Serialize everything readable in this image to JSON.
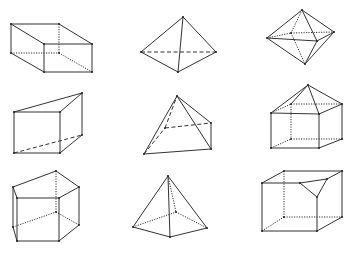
{
  "diagram": {
    "title": "",
    "colors": {
      "line": "#333333",
      "background": "#ffffff"
    },
    "figures": [
      {
        "id": "rectangular-box",
        "solid": [
          [
            11,
            24,
            59,
            24
          ],
          [
            59,
            24,
            92,
            44
          ],
          [
            92,
            44,
            44,
            44
          ],
          [
            44,
            44,
            11,
            24
          ],
          [
            11,
            24,
            11,
            53
          ],
          [
            44,
            44,
            44,
            72
          ],
          [
            92,
            44,
            92,
            72
          ],
          [
            11,
            53,
            44,
            72
          ],
          [
            44,
            72,
            92,
            72
          ]
        ],
        "dashed": [],
        "dotted": [
          [
            59,
            24,
            59,
            53
          ],
          [
            11,
            53,
            59,
            53
          ],
          [
            59,
            53,
            92,
            72
          ]
        ]
      },
      {
        "id": "triangular-pyramid",
        "solid": [
          [
            183,
            17,
            141,
            52
          ],
          [
            183,
            17,
            216,
            52
          ],
          [
            183,
            17,
            178,
            72
          ],
          [
            141,
            52,
            178,
            72
          ],
          [
            178,
            72,
            216,
            52
          ]
        ],
        "dashed": [
          [
            141,
            52,
            216,
            52
          ]
        ],
        "dotted": []
      },
      {
        "id": "octahedron",
        "solid": [
          [
            302,
            10,
            267,
            38
          ],
          [
            302,
            10,
            334,
            32
          ],
          [
            302,
            10,
            317,
            41
          ],
          [
            267,
            38,
            317,
            41
          ],
          [
            317,
            41,
            334,
            32
          ],
          [
            267,
            38,
            305,
            64
          ],
          [
            317,
            41,
            305,
            64
          ],
          [
            334,
            32,
            305,
            64
          ]
        ],
        "dashed": [],
        "dotted": [
          [
            302,
            10,
            291,
            33
          ],
          [
            267,
            38,
            291,
            33
          ],
          [
            291,
            33,
            334,
            32
          ],
          [
            291,
            33,
            305,
            64
          ]
        ]
      },
      {
        "id": "triangular-prism",
        "solid": [
          [
            14,
            112,
            60,
            112
          ],
          [
            60,
            112,
            82,
            93
          ],
          [
            14,
            112,
            82,
            93
          ],
          [
            14,
            112,
            14,
            153
          ],
          [
            60,
            112,
            60,
            153
          ],
          [
            82,
            93,
            82,
            135
          ],
          [
            14,
            153,
            60,
            153
          ],
          [
            60,
            153,
            82,
            135
          ]
        ],
        "dashed": [
          [
            14,
            153,
            82,
            135
          ]
        ],
        "dotted": []
      },
      {
        "id": "square-pyramid-tilted",
        "solid": [
          [
            177,
            96,
            144,
            154
          ],
          [
            177,
            96,
            211,
            123
          ],
          [
            177,
            96,
            211,
            149
          ],
          [
            144,
            154,
            211,
            149
          ],
          [
            211,
            123,
            211,
            149
          ]
        ],
        "dashed": [
          [
            144,
            154,
            165,
            128
          ],
          [
            165,
            128,
            177,
            96
          ],
          [
            165,
            128,
            211,
            123
          ]
        ],
        "dotted": []
      },
      {
        "id": "house-prism-pyramid",
        "solid": [
          [
            308,
            85,
            271,
            113
          ],
          [
            308,
            85,
            319,
            114
          ],
          [
            308,
            85,
            342,
            104
          ],
          [
            308,
            85,
            291,
            104
          ],
          [
            271,
            113,
            319,
            114
          ],
          [
            319,
            114,
            342,
            104
          ],
          [
            271,
            113,
            271,
            148
          ],
          [
            319,
            114,
            319,
            148
          ],
          [
            342,
            104,
            342,
            139
          ],
          [
            271,
            148,
            319,
            148
          ],
          [
            319,
            148,
            342,
            139
          ]
        ],
        "dashed": [],
        "dotted": [
          [
            271,
            113,
            291,
            104
          ],
          [
            291,
            104,
            342,
            104
          ],
          [
            291,
            104,
            291,
            139
          ],
          [
            271,
            148,
            291,
            139
          ],
          [
            291,
            139,
            342,
            139
          ]
        ]
      },
      {
        "id": "pentagonal-prism",
        "solid": [
          [
            13,
            187,
            56,
            171
          ],
          [
            56,
            171,
            79,
            187
          ],
          [
            79,
            187,
            59,
            198
          ],
          [
            59,
            198,
            17,
            198
          ],
          [
            17,
            198,
            13,
            187
          ],
          [
            13,
            187,
            13,
            227
          ],
          [
            79,
            187,
            79,
            225
          ],
          [
            59,
            198,
            59,
            241
          ],
          [
            17,
            198,
            17,
            241
          ],
          [
            13,
            227,
            17,
            241
          ],
          [
            17,
            241,
            59,
            241
          ],
          [
            59,
            241,
            79,
            225
          ]
        ],
        "dashed": [],
        "dotted": [
          [
            56,
            171,
            56,
            212
          ],
          [
            13,
            227,
            56,
            212
          ],
          [
            56,
            212,
            79,
            225
          ]
        ]
      },
      {
        "id": "square-pyramid",
        "solid": [
          [
            168,
            176,
            133,
            227
          ],
          [
            168,
            176,
            170,
            237
          ],
          [
            168,
            176,
            207,
            228
          ],
          [
            133,
            227,
            170,
            237
          ],
          [
            170,
            237,
            207,
            228
          ]
        ],
        "dashed": [],
        "dotted": [
          [
            168,
            176,
            176,
            212
          ],
          [
            133,
            227,
            176,
            212
          ],
          [
            176,
            212,
            207,
            228
          ]
        ]
      },
      {
        "id": "truncated-cube",
        "solid": [
          [
            262,
            183,
            300,
            183
          ],
          [
            300,
            183,
            317,
            197
          ],
          [
            300,
            183,
            327,
            179
          ],
          [
            327,
            179,
            317,
            197
          ],
          [
            317,
            197,
            317,
            231
          ],
          [
            262,
            183,
            262,
            231
          ],
          [
            262,
            231,
            317,
            231
          ],
          [
            317,
            231,
            342,
            217
          ],
          [
            342,
            171,
            342,
            217
          ],
          [
            284,
            171,
            342,
            171
          ],
          [
            262,
            183,
            284,
            171
          ],
          [
            327,
            179,
            342,
            171
          ]
        ],
        "dashed": [],
        "dotted": [
          [
            284,
            171,
            284,
            217
          ],
          [
            262,
            231,
            284,
            217
          ],
          [
            284,
            217,
            342,
            217
          ]
        ]
      }
    ]
  }
}
